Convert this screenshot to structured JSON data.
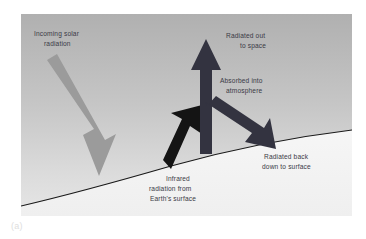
{
  "figure": {
    "caption": "(a)",
    "panel": {
      "width": 331,
      "height": 202,
      "sky_top_color": "#b4b4b4",
      "sky_bottom_color": "#e2e2e2",
      "ground_color": "#f4f4f4",
      "horizon_color": "#1c1c1c",
      "text_color": "#3a3a46"
    },
    "arrows": [
      {
        "id": "incoming-solar",
        "label_key": "incoming_solar",
        "color": "#9a9a9a",
        "direction": "down-right",
        "description": "Incoming solar radiation striking Earth's surface"
      },
      {
        "id": "infrared-up",
        "label_key": "infrared",
        "color": "#1b1b1b",
        "direction": "up-right",
        "description": "Infrared radiation leaving Earth's surface"
      },
      {
        "id": "radiated-out",
        "label_key": "radiated_out",
        "color": "#343440",
        "direction": "up",
        "description": "Radiation escaping to space"
      },
      {
        "id": "radiated-back",
        "label_key": "radiated_back",
        "color": "#343440",
        "direction": "down-right",
        "description": "Radiation re-emitted back down to surface"
      }
    ],
    "labels": {
      "incoming_solar": {
        "line1": "Incoming solar",
        "line2": "radiation"
      },
      "radiated_out": {
        "line1": "Radiated out",
        "line2": "to space"
      },
      "absorbed": {
        "line1": "Absorbed into",
        "line2": "atmosphere"
      },
      "radiated_back": {
        "line1": "Radiated back",
        "line2": "down to surface"
      },
      "infrared": {
        "line1": "Infrared",
        "line2": "radiation from",
        "line3": "Earth's surface"
      }
    }
  }
}
